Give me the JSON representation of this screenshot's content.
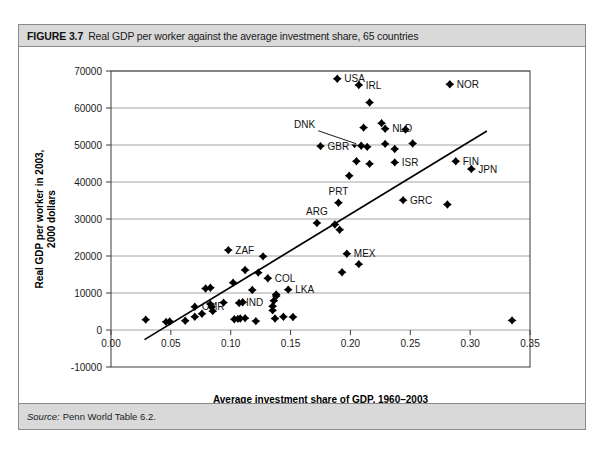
{
  "figure": {
    "number": "FIGURE 3.7",
    "caption": "Real GDP per worker against the average investment share, 65 countries",
    "source_label": "Source:",
    "source_value": "Penn World Table 6.2."
  },
  "chart_data": {
    "type": "scatter",
    "title": "Real GDP per worker against the average investment share, 65 countries",
    "xlabel": "Average investment share of GDP, 1960–2003",
    "ylabel": "Real GDP per worker in 2003,\n2000 dollars",
    "ylabel_line1": "Real GDP per worker in 2003,",
    "ylabel_line2": "2000 dollars",
    "xlim": [
      0.0,
      0.35
    ],
    "ylim": [
      -10000,
      70000
    ],
    "xticks": [
      0.0,
      0.05,
      0.1,
      0.15,
      0.2,
      0.25,
      0.3,
      0.35
    ],
    "xtick_labels": [
      "0.00",
      "0.05",
      "0.10",
      "0.15",
      "0.20",
      "0.25",
      "0.30",
      "0.35"
    ],
    "yticks": [
      -10000,
      0,
      10000,
      20000,
      30000,
      40000,
      50000,
      60000,
      70000
    ],
    "ytick_labels": [
      "-10000",
      "0",
      "10000",
      "20000",
      "30000",
      "40000",
      "50000",
      "60000",
      "70000"
    ],
    "grid": "horizontal",
    "grid_values": [
      10000,
      20000,
      30000,
      40000,
      50000,
      60000,
      70000
    ],
    "legend": "none",
    "n_countries": 65,
    "trend_line": {
      "x0": 0.028,
      "y0": -2600,
      "x1": 0.314,
      "y1": 53800
    },
    "points": [
      {
        "x": 0.189,
        "y": 67900,
        "label": "USA",
        "label_pos": "right"
      },
      {
        "x": 0.207,
        "y": 66200,
        "label": "IRL",
        "label_pos": "right"
      },
      {
        "x": 0.283,
        "y": 66400,
        "label": "NOR",
        "label_pos": "right"
      },
      {
        "x": 0.216,
        "y": 61500,
        "label": "",
        "label_pos": "right"
      },
      {
        "x": 0.226,
        "y": 55900,
        "label": "",
        "label_pos": "right"
      },
      {
        "x": 0.211,
        "y": 54700,
        "label": "",
        "label_pos": "right"
      },
      {
        "x": 0.229,
        "y": 54400,
        "label": "NLD",
        "label_pos": "right"
      },
      {
        "x": 0.246,
        "y": 54200,
        "label": "",
        "label_pos": "right"
      },
      {
        "x": 0.209,
        "y": 49800,
        "label": "DNK",
        "label_pos": "callout"
      },
      {
        "x": 0.214,
        "y": 49500,
        "label": "",
        "label_pos": "right"
      },
      {
        "x": 0.229,
        "y": 50300,
        "label": "",
        "label_pos": "right"
      },
      {
        "x": 0.237,
        "y": 48900,
        "label": "",
        "label_pos": "right"
      },
      {
        "x": 0.175,
        "y": 49700,
        "label": "GBR",
        "label_pos": "right"
      },
      {
        "x": 0.205,
        "y": 45600,
        "label": "",
        "label_pos": "right"
      },
      {
        "x": 0.216,
        "y": 44900,
        "label": "",
        "label_pos": "right"
      },
      {
        "x": 0.237,
        "y": 45300,
        "label": "ISR",
        "label_pos": "right"
      },
      {
        "x": 0.252,
        "y": 50400,
        "label": "",
        "label_pos": "right"
      },
      {
        "x": 0.288,
        "y": 45600,
        "label": "FIN",
        "label_pos": "right"
      },
      {
        "x": 0.301,
        "y": 43500,
        "label": "JPN",
        "label_pos": "right"
      },
      {
        "x": 0.199,
        "y": 41700,
        "label": "",
        "label_pos": "right"
      },
      {
        "x": 0.19,
        "y": 34400,
        "label": "PRT",
        "label_pos": "above"
      },
      {
        "x": 0.244,
        "y": 35100,
        "label": "GRC",
        "label_pos": "right"
      },
      {
        "x": 0.281,
        "y": 33900,
        "label": "",
        "label_pos": "right"
      },
      {
        "x": 0.172,
        "y": 28900,
        "label": "ARG",
        "label_pos": "above"
      },
      {
        "x": 0.187,
        "y": 28500,
        "label": "",
        "label_pos": "right"
      },
      {
        "x": 0.191,
        "y": 27100,
        "label": "",
        "label_pos": "right"
      },
      {
        "x": 0.098,
        "y": 21600,
        "label": "ZAF",
        "label_pos": "right"
      },
      {
        "x": 0.197,
        "y": 20600,
        "label": "MEX",
        "label_pos": "right"
      },
      {
        "x": 0.207,
        "y": 17800,
        "label": "",
        "label_pos": "right"
      },
      {
        "x": 0.193,
        "y": 15600,
        "label": "",
        "label_pos": "right"
      },
      {
        "x": 0.127,
        "y": 19900,
        "label": "",
        "label_pos": "right"
      },
      {
        "x": 0.131,
        "y": 14000,
        "label": "COL",
        "label_pos": "right"
      },
      {
        "x": 0.123,
        "y": 15500,
        "label": "",
        "label_pos": "right"
      },
      {
        "x": 0.112,
        "y": 16200,
        "label": "",
        "label_pos": "right"
      },
      {
        "x": 0.079,
        "y": 11200,
        "label": "",
        "label_pos": "right"
      },
      {
        "x": 0.083,
        "y": 11400,
        "label": "",
        "label_pos": "right"
      },
      {
        "x": 0.102,
        "y": 12800,
        "label": "",
        "label_pos": "right"
      },
      {
        "x": 0.118,
        "y": 10800,
        "label": "",
        "label_pos": "right"
      },
      {
        "x": 0.148,
        "y": 10900,
        "label": "LKA",
        "label_pos": "right"
      },
      {
        "x": 0.138,
        "y": 9200,
        "label": "",
        "label_pos": "right"
      },
      {
        "x": 0.138,
        "y": 9600,
        "label": "",
        "label_pos": "right"
      },
      {
        "x": 0.136,
        "y": 7900,
        "label": "",
        "label_pos": "right"
      },
      {
        "x": 0.135,
        "y": 6400,
        "label": "",
        "label_pos": "right"
      },
      {
        "x": 0.135,
        "y": 5300,
        "label": "",
        "label_pos": "right"
      },
      {
        "x": 0.07,
        "y": 6300,
        "label": "CMR",
        "label_pos": "right"
      },
      {
        "x": 0.107,
        "y": 7300,
        "label": "IND",
        "label_pos": "right"
      },
      {
        "x": 0.11,
        "y": 7500,
        "label": "",
        "label_pos": "right"
      },
      {
        "x": 0.083,
        "y": 7000,
        "label": "",
        "label_pos": "right"
      },
      {
        "x": 0.084,
        "y": 6200,
        "label": "",
        "label_pos": "right"
      },
      {
        "x": 0.085,
        "y": 5100,
        "label": "",
        "label_pos": "right"
      },
      {
        "x": 0.094,
        "y": 7400,
        "label": "",
        "label_pos": "right"
      },
      {
        "x": 0.108,
        "y": 3100,
        "label": "",
        "label_pos": "right"
      },
      {
        "x": 0.112,
        "y": 3200,
        "label": "",
        "label_pos": "right"
      },
      {
        "x": 0.103,
        "y": 2900,
        "label": "",
        "label_pos": "right"
      },
      {
        "x": 0.106,
        "y": 3000,
        "label": "",
        "label_pos": "right"
      },
      {
        "x": 0.121,
        "y": 2400,
        "label": "",
        "label_pos": "right"
      },
      {
        "x": 0.137,
        "y": 3100,
        "label": "",
        "label_pos": "right"
      },
      {
        "x": 0.144,
        "y": 3600,
        "label": "",
        "label_pos": "right"
      },
      {
        "x": 0.152,
        "y": 3500,
        "label": "",
        "label_pos": "right"
      },
      {
        "x": 0.029,
        "y": 2800,
        "label": "",
        "label_pos": "right"
      },
      {
        "x": 0.046,
        "y": 2200,
        "label": "",
        "label_pos": "right"
      },
      {
        "x": 0.049,
        "y": 2300,
        "label": "",
        "label_pos": "right"
      },
      {
        "x": 0.062,
        "y": 2500,
        "label": "",
        "label_pos": "right"
      },
      {
        "x": 0.07,
        "y": 3600,
        "label": "",
        "label_pos": "right"
      },
      {
        "x": 0.076,
        "y": 4400,
        "label": "",
        "label_pos": "right"
      },
      {
        "x": 0.335,
        "y": 2600,
        "label": "",
        "label_pos": "right"
      }
    ]
  }
}
